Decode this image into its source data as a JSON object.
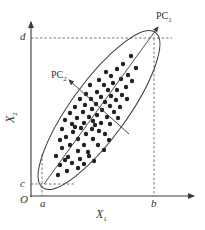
{
  "diagram": {
    "title": "",
    "colors": {
      "line": "#3a3a3a",
      "dots": "#222222",
      "dash": "#555555",
      "background": "#ffffff"
    },
    "axes": {
      "origin_label": "O",
      "x_label_main": "X",
      "x_label_sub": "1",
      "y_label_main": "X",
      "y_label_sub": "2"
    },
    "ticks": {
      "a": "a",
      "b": "b",
      "c": "c",
      "d": "d"
    },
    "principal_components": {
      "pc1_main": "PC",
      "pc1_sub": "1",
      "pc2_main": "PC",
      "pc2_sub": "2"
    },
    "shapes": {
      "ellipse": {
        "cx": 99,
        "cy": 110,
        "rx": 96,
        "ry": 28,
        "rotation_deg": -54
      },
      "pc1_axis": {
        "x1": 44,
        "y1": 184,
        "x2": 158,
        "y2": 27
      },
      "pc2_axis": {
        "x1": 129,
        "y1": 134,
        "x2": 69,
        "y2": 80
      }
    },
    "points": [
      [
        131,
        56
      ],
      [
        123,
        64
      ],
      [
        136,
        68
      ],
      [
        117,
        69
      ],
      [
        106,
        72
      ],
      [
        128,
        75
      ],
      [
        111,
        76
      ],
      [
        121,
        79
      ],
      [
        99,
        80
      ],
      [
        132,
        81
      ],
      [
        113,
        83
      ],
      [
        104,
        85
      ],
      [
        126,
        87
      ],
      [
        90,
        85
      ],
      [
        117,
        90
      ],
      [
        108,
        90
      ],
      [
        97,
        92
      ],
      [
        122,
        95
      ],
      [
        86,
        94
      ],
      [
        111,
        96
      ],
      [
        101,
        97
      ],
      [
        91,
        99
      ],
      [
        116,
        100
      ],
      [
        127,
        99
      ],
      [
        80,
        99
      ],
      [
        105,
        102
      ],
      [
        96,
        104
      ],
      [
        85,
        105
      ],
      [
        110,
        106
      ],
      [
        120,
        107
      ],
      [
        75,
        107
      ],
      [
        92,
        109
      ],
      [
        102,
        110
      ],
      [
        114,
        112
      ],
      [
        83,
        112
      ],
      [
        70,
        113
      ],
      [
        97,
        115
      ],
      [
        89,
        117
      ],
      [
        107,
        117
      ],
      [
        77,
        118
      ],
      [
        118,
        118
      ],
      [
        65,
        120
      ],
      [
        93,
        121
      ],
      [
        101,
        123
      ],
      [
        84,
        123
      ],
      [
        72,
        124
      ],
      [
        110,
        124
      ],
      [
        81,
        128
      ],
      [
        92,
        129
      ],
      [
        62,
        129
      ],
      [
        99,
        131
      ],
      [
        73,
        132
      ],
      [
        86,
        134
      ],
      [
        105,
        134
      ],
      [
        66,
        137
      ],
      [
        78,
        139
      ],
      [
        93,
        139
      ],
      [
        60,
        140
      ],
      [
        84,
        145
      ],
      [
        70,
        145
      ],
      [
        98,
        145
      ],
      [
        62,
        148
      ],
      [
        78,
        151
      ],
      [
        88,
        152
      ],
      [
        56,
        156
      ],
      [
        68,
        157
      ],
      [
        80,
        159
      ],
      [
        65,
        160
      ],
      [
        72,
        163
      ],
      [
        60,
        165
      ],
      [
        84,
        164
      ],
      [
        67,
        171
      ],
      [
        78,
        168
      ],
      [
        58,
        175
      ],
      [
        89,
        156
      ],
      [
        94,
        161
      ],
      [
        104,
        150
      ],
      [
        109,
        140
      ],
      [
        75,
        127
      ],
      [
        95,
        125
      ]
    ]
  }
}
